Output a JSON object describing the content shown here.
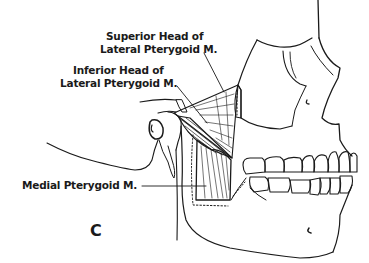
{
  "figure": {
    "panel_letter": "C",
    "colors": {
      "ink": "#1a1a1a",
      "background": "#ffffff"
    }
  },
  "labels": {
    "superior_head_line1": "Superior Head of",
    "superior_head_line2": "Lateral Pterygoid M.",
    "inferior_head_line1": "Inferior Head of",
    "inferior_head_line2": "Lateral Pterygoid M.",
    "medial_pterygoid": "Medial Pterygoid M."
  }
}
